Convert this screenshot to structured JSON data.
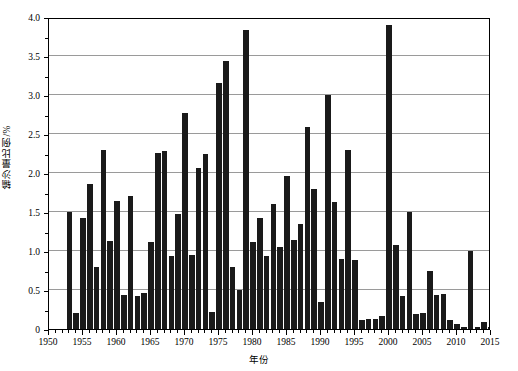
{
  "chart_data": {
    "type": "bar",
    "title": "",
    "xlabel": "年份",
    "ylabel": "输沙量比例/%",
    "xlim": [
      1950,
      2015
    ],
    "ylim": [
      0,
      4.0
    ],
    "grid": true,
    "legend": null,
    "bar_color": "#1a1a1a",
    "x_ticks": [
      1950,
      1955,
      1960,
      1965,
      1970,
      1975,
      1980,
      1985,
      1990,
      1995,
      2000,
      2005,
      2010,
      2015
    ],
    "x_tick_labels": [
      "1950",
      "1955",
      "1960",
      "1965",
      "1970",
      "1975",
      "1980",
      "1985",
      "1990",
      "1995",
      "2000",
      "2005",
      "2010",
      "2015"
    ],
    "x_minor_tick_step": 1,
    "y_ticks": [
      0,
      0.5,
      1.0,
      1.5,
      2.0,
      2.5,
      3.0,
      3.5,
      4.0
    ],
    "y_tick_labels": [
      "0",
      "0.5",
      "1.0",
      "1.5",
      "2.0",
      "2.5",
      "3.0",
      "3.5",
      "4.0"
    ],
    "categories": [
      1953,
      1954,
      1955,
      1956,
      1957,
      1958,
      1959,
      1960,
      1961,
      1962,
      1963,
      1964,
      1965,
      1966,
      1967,
      1968,
      1969,
      1970,
      1971,
      1972,
      1973,
      1974,
      1975,
      1976,
      1977,
      1978,
      1979,
      1980,
      1981,
      1982,
      1983,
      1984,
      1985,
      1986,
      1987,
      1988,
      1989,
      1990,
      1991,
      1992,
      1993,
      1994,
      1995,
      1996,
      1997,
      1998,
      1999,
      2000,
      2001,
      2002,
      2003,
      2004,
      2005,
      2006,
      2007,
      2008,
      2009,
      2010,
      2011,
      2012,
      2013,
      2014,
      2015
    ],
    "values": [
      1.5,
      0.2,
      1.42,
      1.86,
      0.8,
      2.3,
      1.13,
      1.64,
      0.44,
      1.7,
      0.42,
      0.46,
      1.11,
      2.26,
      2.28,
      0.93,
      1.47,
      2.77,
      0.95,
      2.06,
      2.24,
      0.22,
      3.16,
      3.43,
      0.8,
      0.5,
      3.83,
      1.11,
      1.42,
      0.93,
      1.6,
      1.05,
      1.96,
      1.14,
      1.35,
      2.59,
      1.8,
      0.35,
      3.0,
      1.63,
      0.9,
      2.3,
      0.88,
      0.12,
      0.13,
      0.13,
      0.17,
      3.9,
      1.08,
      0.42,
      1.5,
      0.19,
      0.21,
      0.75,
      0.44,
      0.45,
      0.12,
      0.06,
      0.02,
      1.0,
      0.02,
      0.09,
      0.02
    ]
  },
  "axes": {
    "y_title": "输沙量比例/%",
    "x_title": "年份"
  }
}
